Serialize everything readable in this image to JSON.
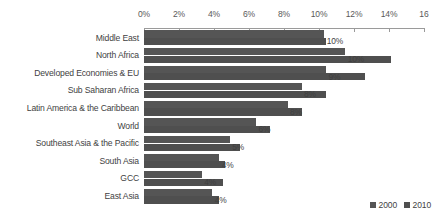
{
  "chart_data": {
    "type": "bar",
    "orientation": "horizontal",
    "title": "",
    "subtitle": "",
    "xlabel": "",
    "ylabel": "",
    "xlim": [
      0,
      16
    ],
    "xunit": "%",
    "grid": false,
    "legend_position": "bottom-right",
    "tick_labels": [
      "0%",
      "2%",
      "4%",
      "6%",
      "8%",
      "10%",
      "12%",
      "14%",
      "16"
    ],
    "ticks": [
      0,
      2,
      4,
      6,
      8,
      10,
      12,
      14,
      16
    ],
    "categories": [
      "Middle East",
      "North Africa",
      "Developed Economies & EU",
      "Sub Saharan Africa",
      "Latin America & the Caribbean",
      "World",
      "Southeast Asia & the Pacific",
      "South Asia",
      "GCC",
      "East Asia"
    ],
    "series": [
      {
        "name": "2000",
        "values": [
          10.3,
          11.5,
          10.4,
          9.0,
          8.2,
          6.4,
          4.9,
          4.3,
          3.3,
          3.9
        ]
      },
      {
        "name": "2010",
        "values": [
          10.4,
          14.1,
          12.6,
          10.4,
          9.0,
          7.2,
          5.5,
          4.6,
          4.5,
          4.3
        ]
      }
    ],
    "data_labels": [
      "10%",
      "10%",
      "9%",
      "8%",
      "8%",
      "6%",
      "5%",
      "4%",
      "4%",
      "4%"
    ],
    "colors": {
      "series_2000": "#555555",
      "series_2010": "#4f4f4f",
      "axis": "#9a9a9a",
      "text": "#3f3f3f",
      "background": "#ffffff"
    }
  },
  "legend": {
    "items": [
      {
        "label": "2000"
      },
      {
        "label": "2010"
      }
    ]
  }
}
